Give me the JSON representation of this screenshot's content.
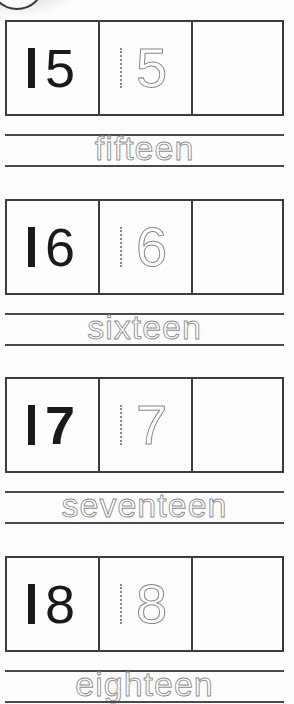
{
  "worksheet": {
    "rows": [
      {
        "number": "15",
        "first_digit": "1",
        "second_digit": "5",
        "traced_number": "5",
        "word": "fifteen",
        "answer_box": ""
      },
      {
        "number": "16",
        "first_digit": "1",
        "second_digit": "6",
        "traced_number": "6",
        "word": "sixteen",
        "answer_box": ""
      },
      {
        "number": "17",
        "first_digit": "1",
        "second_digit": "7",
        "traced_number": "7",
        "word": "seventeen",
        "answer_box": ""
      },
      {
        "number": "18",
        "first_digit": "1",
        "second_digit": "8",
        "traced_number": "8",
        "word": "eighteen",
        "answer_box": ""
      }
    ],
    "colors": {
      "solid_digit": "#1a1a1a",
      "trace_digit": "#8a8a8a",
      "border": "#3c3c3c",
      "background": "#fdfdfd"
    }
  }
}
